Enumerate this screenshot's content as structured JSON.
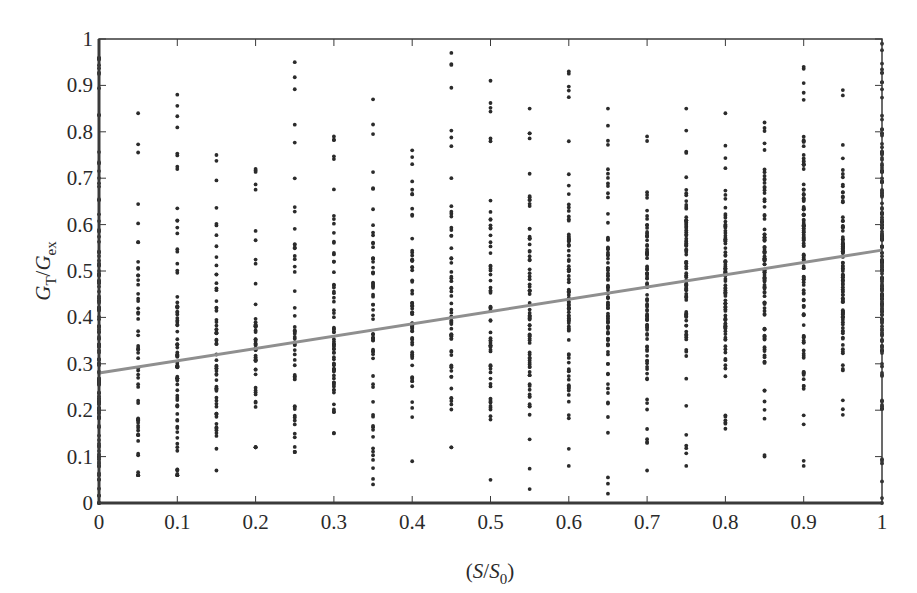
{
  "chart_data": {
    "type": "scatter",
    "title": "",
    "xlabel": "(S/S0)",
    "ylabel": "GT/Gex",
    "xlabel_parts": {
      "open": "(",
      "S": "S",
      "slash": "/",
      "S0": "S",
      "sub0": "0",
      "close": ")"
    },
    "ylabel_parts": {
      "G1": "G",
      "subT": "T",
      "slash": "/",
      "G2": "G",
      "subEx": "ex"
    },
    "xlim": [
      0,
      1
    ],
    "ylim": [
      0,
      1
    ],
    "grid": false,
    "legend": null,
    "x_ticks": [
      "0",
      "0.1",
      "0.2",
      "0.3",
      "0.4",
      "0.5",
      "0.6",
      "0.7",
      "0.8",
      "0.9",
      "1"
    ],
    "y_ticks": [
      "0",
      "0.1",
      "0.2",
      "0.3",
      "0.4",
      "0.5",
      "0.6",
      "0.7",
      "0.8",
      "0.9",
      "1"
    ],
    "marker_color": "#2b2b2b",
    "line_color": "#8f8f8f",
    "axis_color": "#3a3a3a",
    "series": [
      {
        "name": "observations",
        "kind": "scatter",
        "columns": [
          {
            "x": 0.0,
            "ymin": 0.0,
            "ymax": 0.96,
            "count": 140
          },
          {
            "x": 0.05,
            "ymin": 0.06,
            "ymax": 0.84,
            "count": 55
          },
          {
            "x": 0.1,
            "ymin": 0.06,
            "ymax": 0.88,
            "count": 80
          },
          {
            "x": 0.15,
            "ymin": 0.07,
            "ymax": 0.75,
            "count": 60
          },
          {
            "x": 0.2,
            "ymin": 0.12,
            "ymax": 0.72,
            "count": 50
          },
          {
            "x": 0.25,
            "ymin": 0.11,
            "ymax": 0.95,
            "count": 50
          },
          {
            "x": 0.3,
            "ymin": 0.15,
            "ymax": 0.79,
            "count": 65
          },
          {
            "x": 0.35,
            "ymin": 0.04,
            "ymax": 0.87,
            "count": 60
          },
          {
            "x": 0.4,
            "ymin": 0.09,
            "ymax": 0.76,
            "count": 65
          },
          {
            "x": 0.45,
            "ymin": 0.12,
            "ymax": 0.97,
            "count": 60
          },
          {
            "x": 0.5,
            "ymin": 0.05,
            "ymax": 0.91,
            "count": 60
          },
          {
            "x": 0.55,
            "ymin": 0.03,
            "ymax": 0.85,
            "count": 75
          },
          {
            "x": 0.6,
            "ymin": 0.08,
            "ymax": 0.93,
            "count": 85
          },
          {
            "x": 0.65,
            "ymin": 0.02,
            "ymax": 0.85,
            "count": 80
          },
          {
            "x": 0.7,
            "ymin": 0.07,
            "ymax": 0.79,
            "count": 85
          },
          {
            "x": 0.75,
            "ymin": 0.08,
            "ymax": 0.85,
            "count": 85
          },
          {
            "x": 0.8,
            "ymin": 0.16,
            "ymax": 0.84,
            "count": 95
          },
          {
            "x": 0.85,
            "ymin": 0.1,
            "ymax": 0.82,
            "count": 95
          },
          {
            "x": 0.9,
            "ymin": 0.08,
            "ymax": 0.94,
            "count": 110
          },
          {
            "x": 0.95,
            "ymin": 0.19,
            "ymax": 0.89,
            "count": 100
          },
          {
            "x": 1.0,
            "ymin": 0.0,
            "ymax": 0.99,
            "count": 160
          }
        ]
      },
      {
        "name": "linear fit",
        "kind": "line",
        "x": [
          0,
          1
        ],
        "y": [
          0.28,
          0.545
        ]
      }
    ]
  }
}
